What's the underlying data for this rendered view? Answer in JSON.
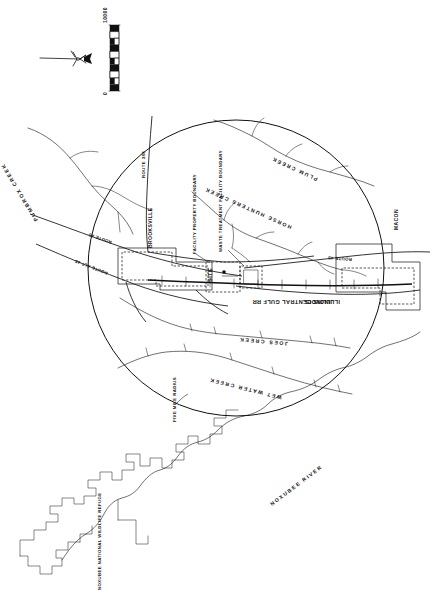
{
  "map": {
    "title": "Site Location Map",
    "scale_bar": {
      "max_label": "10000",
      "min_label": "0",
      "units_implied": "feet",
      "segments": 5
    },
    "north_arrow": "north-arrow",
    "radius_circle": {
      "label": "FIVE MILE RADIUS",
      "center_label": "SITE"
    },
    "labels": {
      "site": "SITE",
      "brooksville": "BROOKSVILLE",
      "macon": "MACON",
      "illinois": "ILLINOIS",
      "facility_property_boundary": "FACILITY PROPERTY BOUNDARY",
      "waste_treatment_facility_boundary": "WASTE TREATMENT FACILITY BOUNDARY",
      "five_mile_radius": "FIVE MILE RADIUS",
      "railroad": "ILLINOIS CENTRAL GULF RR",
      "refuge": "NOXUBEE NATIONAL WILDLIFE REFUGE"
    },
    "roads": [
      {
        "name": "ROUTE 388"
      },
      {
        "name": "ROUTE 45"
      },
      {
        "name": "ROUTE ALT 45"
      },
      {
        "name": "ROUTE 45"
      }
    ],
    "waterways": [
      {
        "name": "PUMBROX CREEK"
      },
      {
        "name": "PLUM CREEK"
      },
      {
        "name": "HORSE HUNTERS CREEK"
      },
      {
        "name": "JOES CREEK"
      },
      {
        "name": "WET WATER CREEK"
      },
      {
        "name": "NOXUBEE RIVER"
      }
    ],
    "colors": {
      "ink": "#111111",
      "paper": "#ffffff"
    }
  }
}
